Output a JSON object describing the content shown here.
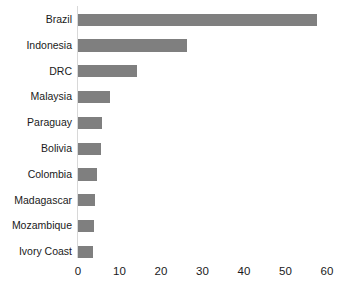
{
  "chart_data": {
    "type": "bar",
    "orientation": "horizontal",
    "title": "",
    "subtitle": "",
    "xlabel": "",
    "ylabel": "",
    "categories": [
      "Brazil",
      "Indonesia",
      "DRC",
      "Malaysia",
      "Paraguay",
      "Bolivia",
      "Colombia",
      "Madagascar",
      "Mozambique",
      "Ivory Coast"
    ],
    "values": [
      57.6,
      26.3,
      14.2,
      7.7,
      5.8,
      5.5,
      4.5,
      4.2,
      3.8,
      3.5
    ],
    "xlim": [
      0,
      60
    ],
    "x_ticks": [
      0,
      10,
      20,
      30,
      40,
      50,
      60
    ],
    "x_tick_labels": [
      "0",
      "10",
      "20",
      "30",
      "40",
      "50",
      "60"
    ],
    "grid": false,
    "legend": null,
    "legend_position": "none",
    "bar_color": "#7f7f7f",
    "axis_color": "#d8d8d8",
    "background_color": "#ffffff",
    "text_color": "#1a1a1a",
    "annotations": []
  }
}
